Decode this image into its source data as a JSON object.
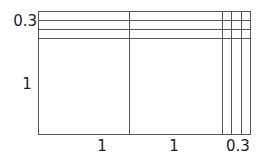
{
  "diagram": {
    "type": "area-model-grid",
    "line_color": "#555555",
    "text_color": "#222222",
    "outer_rect": {
      "x": 38.5,
      "y": 11.5,
      "width": 211.5,
      "height": 123
    },
    "horizontal_lines_y": [
      20.5,
      29.5,
      38.5
    ],
    "vertical_lines_x": [
      129.5,
      222.5,
      231.5,
      241.5
    ],
    "left_labels": [
      {
        "text": "0.3",
        "x": 37,
        "y": 26,
        "anchor": "end"
      },
      {
        "text": "1",
        "x": 27,
        "y": 89,
        "anchor": "middle"
      }
    ],
    "bottom_labels": [
      {
        "text": "1",
        "x": 102,
        "y": 151,
        "anchor": "middle"
      },
      {
        "text": "1",
        "x": 174,
        "y": 151,
        "anchor": "middle"
      },
      {
        "text": "0.3",
        "x": 238,
        "y": 151,
        "anchor": "middle"
      }
    ],
    "dimensions": {
      "width_parts": [
        "1",
        "1",
        "0.3"
      ],
      "height_parts": [
        "0.3",
        "1"
      ]
    }
  }
}
